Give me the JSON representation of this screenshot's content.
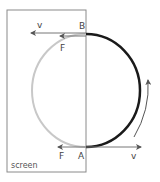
{
  "diagram": {
    "title": "",
    "screen_label": "screen",
    "points": {
      "top": "B",
      "bottom": "A"
    },
    "vectors": {
      "top_velocity_label": "v",
      "top_force_label": "F",
      "bottom_velocity_label": "v",
      "bottom_force_label": "F"
    },
    "colors": {
      "visible_arc": "#1a1a1a",
      "hidden_arc": "#c8c8c8",
      "screen_border": "#8a8a8a",
      "arrows": "#666666",
      "background": "#ffffff"
    },
    "rotation_direction": "counter-clockwise"
  }
}
